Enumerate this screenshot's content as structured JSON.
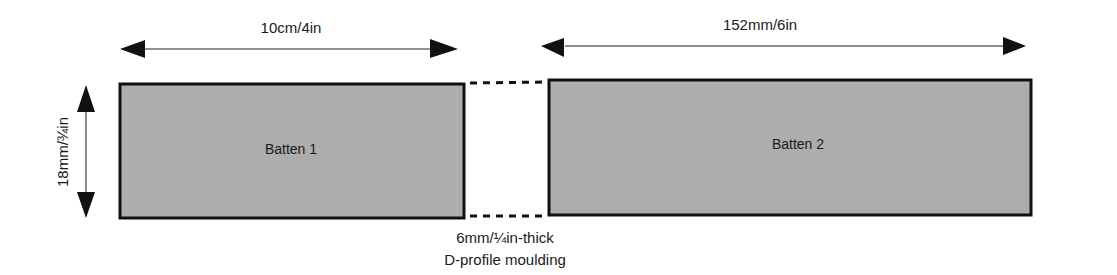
{
  "diagram": {
    "dimensions": {
      "batten1_width": "10cm/4in",
      "batten2_width": "152mm/6in",
      "height": "18mm/¾in"
    },
    "battens": [
      {
        "label": "Batten 1"
      },
      {
        "label": "Batten 2"
      }
    ],
    "moulding": {
      "line1": "6mm/¼in-thick",
      "line2": "D-profile moulding"
    },
    "colors": {
      "batten_fill": "#adadad",
      "stroke": "#111111",
      "background": "#ffffff"
    }
  }
}
